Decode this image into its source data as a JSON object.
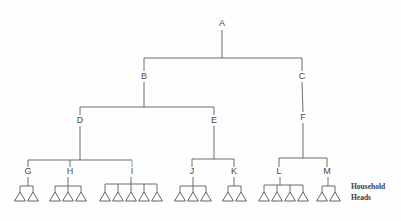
{
  "diagram": {
    "type": "hierarchy-tree",
    "background_color": "#fefefe",
    "line_color": "#5d5d5d",
    "label_color": "#4a4a4a",
    "caption": {
      "line1": "Household",
      "line2": "Heads"
    },
    "household_head_symbol": "triangle",
    "nodes": [
      {
        "id": "A",
        "label": "A",
        "x": 222,
        "y": 26,
        "level": 0,
        "parent": null
      },
      {
        "id": "B",
        "label": "B",
        "x": 144,
        "y": 79,
        "level": 1,
        "parent": "A"
      },
      {
        "id": "C",
        "label": "C",
        "x": 302,
        "y": 79,
        "level": 1,
        "parent": "A"
      },
      {
        "id": "D",
        "label": "D",
        "x": 80,
        "y": 123,
        "level": 2,
        "parent": "B"
      },
      {
        "id": "E",
        "label": "E",
        "x": 214,
        "y": 123,
        "level": 2,
        "parent": "B"
      },
      {
        "id": "F",
        "label": "F",
        "x": 303,
        "y": 120,
        "level": 2,
        "parent": "C"
      },
      {
        "id": "G",
        "label": "G",
        "x": 28,
        "y": 174,
        "level": 3,
        "parent": "D"
      },
      {
        "id": "H",
        "label": "H",
        "x": 70,
        "y": 174,
        "level": 3,
        "parent": "D"
      },
      {
        "id": "I",
        "label": "I",
        "x": 132,
        "y": 174,
        "level": 3,
        "parent": "D"
      },
      {
        "id": "J",
        "label": "J",
        "x": 192,
        "y": 174,
        "level": 3,
        "parent": "E"
      },
      {
        "id": "K",
        "label": "K",
        "x": 234,
        "y": 174,
        "level": 3,
        "parent": "E"
      },
      {
        "id": "L",
        "label": "L",
        "x": 279,
        "y": 174,
        "level": 3,
        "parent": "F"
      },
      {
        "id": "M",
        "label": "M",
        "x": 327,
        "y": 174,
        "level": 3,
        "parent": "F"
      }
    ],
    "household_groups": [
      {
        "parent": "G",
        "count": 2,
        "xs": [
          20,
          33
        ]
      },
      {
        "parent": "H",
        "count": 3,
        "xs": [
          55,
          68,
          81
        ]
      },
      {
        "parent": "I",
        "count": 5,
        "xs": [
          105,
          118,
          131,
          144,
          157
        ]
      },
      {
        "parent": "J",
        "count": 3,
        "xs": [
          180,
          193,
          206
        ]
      },
      {
        "parent": "K",
        "count": 2,
        "xs": [
          228,
          241
        ]
      },
      {
        "parent": "L",
        "count": 4,
        "xs": [
          264,
          277,
          290,
          303
        ]
      },
      {
        "parent": "M",
        "count": 2,
        "xs": [
          322,
          335
        ]
      }
    ],
    "household_total": 21
  },
  "chart_data": {
    "type": "table",
    "xlabel": "",
    "ylabel": "",
    "categories": [
      "G",
      "H",
      "I",
      "J",
      "K",
      "L",
      "M"
    ],
    "values": [
      2,
      3,
      5,
      3,
      2,
      4,
      2
    ],
    "series": [
      {
        "name": "Household Heads",
        "values": [
          2,
          3,
          5,
          3,
          2,
          4,
          2
        ]
      }
    ],
    "edges": [
      [
        "A",
        "B"
      ],
      [
        "A",
        "C"
      ],
      [
        "B",
        "D"
      ],
      [
        "B",
        "E"
      ],
      [
        "C",
        "F"
      ],
      [
        "D",
        "G"
      ],
      [
        "D",
        "H"
      ],
      [
        "D",
        "I"
      ],
      [
        "E",
        "J"
      ],
      [
        "E",
        "K"
      ],
      [
        "F",
        "L"
      ],
      [
        "F",
        "M"
      ]
    ],
    "legend": [
      "Household Heads"
    ],
    "grid": false
  }
}
